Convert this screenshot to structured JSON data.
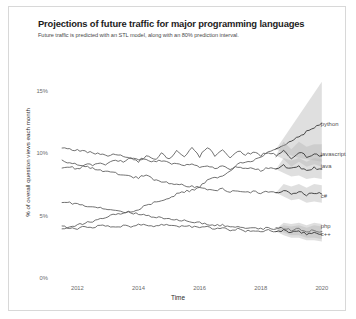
{
  "figure": {
    "title": "Projections of future traffic for major programming languages",
    "subtitle": "Future traffic is predicted with an STL model, along with an 80% prediction interval.",
    "background": "#ffffff",
    "border_color": "#d8d8d8",
    "line_color": "#595959",
    "band_color": "#b8b8b8"
  },
  "chart_data": {
    "type": "line",
    "title": "Projections of future traffic for major programming languages",
    "subtitle": "Future traffic is predicted with an STL model, along with an 80% prediction interval.",
    "xlabel": "Time",
    "ylabel": "% of overall question views each month",
    "xlim": [
      2011.3,
      2020.3
    ],
    "ylim": [
      0,
      16.5
    ],
    "xticks": [
      2012,
      2014,
      2016,
      2018,
      2020
    ],
    "xtick_labels": [
      "2012",
      "2014",
      "2016",
      "2018",
      "2020"
    ],
    "yticks": [
      0,
      5,
      10,
      15
    ],
    "ytick_labels": [
      "0%",
      "5%",
      "10%",
      "15%"
    ],
    "grid": false,
    "legend": "right-inline-labels",
    "forecast_start": 2018.5,
    "prediction_interval": "80%",
    "series": [
      {
        "name": "python",
        "label": "python",
        "label_x": 2019.9,
        "label_y": 12.3,
        "x": [
          2011.5,
          2011.75,
          2012.0,
          2012.25,
          2012.5,
          2012.75,
          2013.0,
          2013.25,
          2013.5,
          2013.75,
          2014.0,
          2014.25,
          2014.5,
          2014.75,
          2015.0,
          2015.25,
          2015.5,
          2015.75,
          2016.0,
          2016.25,
          2016.5,
          2016.75,
          2017.0,
          2017.25,
          2017.5,
          2017.75,
          2018.0,
          2018.25,
          2018.5
        ],
        "y": [
          4.0,
          4.2,
          4.3,
          4.5,
          4.6,
          4.8,
          5.0,
          5.2,
          5.3,
          5.4,
          5.6,
          5.9,
          6.1,
          6.2,
          6.4,
          6.8,
          7.0,
          7.1,
          7.4,
          7.9,
          8.1,
          8.2,
          8.6,
          9.2,
          9.4,
          9.5,
          9.8,
          10.2,
          10.4
        ],
        "forecast_x": [
          2018.5,
          2018.75,
          2019.0,
          2019.25,
          2019.5,
          2019.75,
          2020.0
        ],
        "forecast_y": [
          10.4,
          10.7,
          11.1,
          11.4,
          11.8,
          12.1,
          12.5
        ],
        "forecast_lower": [
          10.4,
          10.1,
          9.9,
          9.7,
          9.6,
          9.5,
          9.4
        ],
        "forecast_upper": [
          10.4,
          11.3,
          12.2,
          13.1,
          14.0,
          14.9,
          15.8
        ]
      },
      {
        "name": "javascript",
        "label": "javascript",
        "label_x": 2019.9,
        "label_y": 9.9,
        "x": [
          2011.5,
          2011.75,
          2012.0,
          2012.25,
          2012.5,
          2012.75,
          2013.0,
          2013.25,
          2013.5,
          2013.75,
          2014.0,
          2014.25,
          2014.5,
          2014.75,
          2015.0,
          2015.25,
          2015.5,
          2015.75,
          2016.0,
          2016.25,
          2016.5,
          2016.75,
          2017.0,
          2017.25,
          2017.5,
          2017.75,
          2018.0,
          2018.25,
          2018.5
        ],
        "y": [
          8.9,
          9.0,
          8.8,
          9.2,
          9.1,
          9.3,
          9.2,
          9.6,
          9.3,
          9.7,
          9.4,
          9.9,
          9.5,
          10.0,
          9.6,
          10.3,
          9.7,
          10.5,
          9.8,
          10.6,
          9.9,
          10.4,
          9.8,
          10.3,
          9.9,
          10.2,
          9.9,
          10.1,
          9.9
        ],
        "forecast_x": [
          2018.5,
          2018.75,
          2019.0,
          2019.25,
          2019.5,
          2019.75,
          2020.0
        ],
        "forecast_y": [
          9.9,
          10.3,
          9.7,
          10.2,
          9.8,
          10.0,
          9.9
        ],
        "forecast_lower": [
          9.9,
          9.6,
          9.0,
          9.4,
          9.0,
          9.2,
          9.0
        ],
        "forecast_upper": [
          9.9,
          11.0,
          10.4,
          11.0,
          10.6,
          10.8,
          10.8
        ]
      },
      {
        "name": "java",
        "label": "java",
        "label_x": 2019.9,
        "label_y": 9.0,
        "x": [
          2011.5,
          2011.75,
          2012.0,
          2012.25,
          2012.5,
          2012.75,
          2013.0,
          2013.25,
          2013.5,
          2013.75,
          2014.0,
          2014.25,
          2014.5,
          2014.75,
          2015.0,
          2015.25,
          2015.5,
          2015.75,
          2016.0,
          2016.25,
          2016.5,
          2016.75,
          2017.0,
          2017.25,
          2017.5,
          2017.75,
          2018.0,
          2018.25,
          2018.5
        ],
        "y": [
          10.5,
          10.4,
          10.3,
          10.2,
          10.1,
          10.0,
          9.9,
          10.0,
          9.8,
          9.7,
          9.6,
          9.5,
          9.4,
          9.5,
          9.3,
          9.2,
          9.1,
          9.2,
          9.0,
          9.1,
          8.9,
          9.0,
          8.8,
          9.0,
          8.8,
          8.9,
          8.7,
          8.9,
          8.8
        ],
        "forecast_x": [
          2018.5,
          2018.75,
          2019.0,
          2019.25,
          2019.5,
          2019.75,
          2020.0
        ],
        "forecast_y": [
          8.8,
          9.1,
          8.8,
          9.0,
          8.7,
          8.9,
          8.8
        ],
        "forecast_lower": [
          8.8,
          8.5,
          8.2,
          8.3,
          8.0,
          8.1,
          8.0
        ],
        "forecast_upper": [
          8.8,
          9.7,
          9.5,
          9.7,
          9.4,
          9.7,
          9.6
        ]
      },
      {
        "name": "c#",
        "label": "c#",
        "label_x": 2019.9,
        "label_y": 6.6,
        "x": [
          2011.5,
          2011.75,
          2012.0,
          2012.25,
          2012.5,
          2012.75,
          2013.0,
          2013.25,
          2013.5,
          2013.75,
          2014.0,
          2014.25,
          2014.5,
          2014.75,
          2015.0,
          2015.25,
          2015.5,
          2015.75,
          2016.0,
          2016.25,
          2016.5,
          2016.75,
          2017.0,
          2017.25,
          2017.5,
          2017.75,
          2018.0,
          2018.25,
          2018.5
        ],
        "y": [
          9.5,
          9.3,
          9.2,
          9.0,
          8.9,
          8.7,
          8.6,
          8.5,
          8.3,
          8.2,
          8.1,
          8.4,
          7.9,
          7.8,
          7.7,
          7.6,
          7.5,
          7.4,
          7.3,
          7.2,
          7.1,
          7.2,
          7.0,
          7.1,
          6.9,
          7.0,
          6.9,
          7.0,
          6.9
        ],
        "forecast_x": [
          2018.5,
          2018.75,
          2019.0,
          2019.25,
          2019.5,
          2019.75,
          2020.0
        ],
        "forecast_y": [
          6.9,
          7.1,
          6.8,
          7.0,
          6.7,
          6.9,
          6.8
        ],
        "forecast_lower": [
          6.9,
          6.6,
          6.3,
          6.4,
          6.1,
          6.2,
          6.1
        ],
        "forecast_upper": [
          6.9,
          7.6,
          7.4,
          7.6,
          7.3,
          7.6,
          7.5
        ]
      },
      {
        "name": "php",
        "label": "php",
        "label_x": 2019.9,
        "label_y": 4.2,
        "x": [
          2011.5,
          2011.75,
          2012.0,
          2012.25,
          2012.5,
          2012.75,
          2013.0,
          2013.25,
          2013.5,
          2013.75,
          2014.0,
          2014.25,
          2014.5,
          2014.75,
          2015.0,
          2015.25,
          2015.5,
          2015.75,
          2016.0,
          2016.25,
          2016.5,
          2016.75,
          2017.0,
          2017.25,
          2017.5,
          2017.75,
          2018.0,
          2018.25,
          2018.5
        ],
        "y": [
          6.2,
          6.1,
          6.0,
          5.9,
          5.8,
          5.7,
          5.6,
          5.5,
          5.4,
          5.3,
          5.2,
          5.1,
          5.0,
          4.9,
          4.8,
          4.7,
          4.7,
          4.6,
          4.5,
          4.4,
          4.3,
          4.3,
          4.2,
          4.2,
          4.1,
          4.1,
          4.0,
          4.1,
          4.0
        ],
        "forecast_x": [
          2018.5,
          2018.75,
          2019.0,
          2019.25,
          2019.5,
          2019.75,
          2020.0
        ],
        "forecast_y": [
          4.0,
          4.1,
          3.9,
          4.0,
          3.8,
          3.9,
          3.8
        ],
        "forecast_lower": [
          4.0,
          3.7,
          3.5,
          3.5,
          3.3,
          3.3,
          3.2
        ],
        "forecast_upper": [
          4.0,
          4.5,
          4.4,
          4.5,
          4.3,
          4.5,
          4.4
        ]
      },
      {
        "name": "c++",
        "label": "c++",
        "label_x": 2019.9,
        "label_y": 3.5,
        "x": [
          2011.5,
          2011.75,
          2012.0,
          2012.25,
          2012.5,
          2012.75,
          2013.0,
          2013.25,
          2013.5,
          2013.75,
          2014.0,
          2014.25,
          2014.5,
          2014.75,
          2015.0,
          2015.25,
          2015.5,
          2015.75,
          2016.0,
          2016.25,
          2016.5,
          2016.75,
          2017.0,
          2017.25,
          2017.5,
          2017.75,
          2018.0,
          2018.25,
          2018.5
        ],
        "y": [
          4.2,
          4.1,
          4.0,
          4.2,
          4.1,
          4.3,
          4.2,
          4.1,
          4.3,
          4.2,
          4.4,
          4.3,
          4.2,
          4.4,
          4.3,
          4.2,
          4.3,
          4.2,
          4.1,
          4.2,
          4.0,
          4.1,
          3.9,
          4.0,
          3.8,
          3.9,
          3.8,
          3.9,
          3.8
        ],
        "forecast_x": [
          2018.5,
          2018.75,
          2019.0,
          2019.25,
          2019.5,
          2019.75,
          2020.0
        ],
        "forecast_y": [
          3.8,
          3.9,
          3.7,
          3.8,
          3.6,
          3.7,
          3.6
        ],
        "forecast_lower": [
          3.8,
          3.5,
          3.3,
          3.3,
          3.1,
          3.1,
          3.0
        ],
        "forecast_upper": [
          3.8,
          4.3,
          4.2,
          4.3,
          4.1,
          4.3,
          4.2
        ]
      }
    ]
  }
}
